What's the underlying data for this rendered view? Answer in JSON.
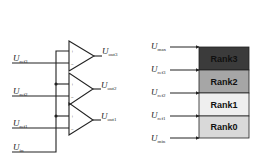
{
  "comparator_circuit": {
    "inputs": [
      {
        "base": "U",
        "sub": "ref3"
      },
      {
        "base": "U",
        "sub": "ref2"
      },
      {
        "base": "U",
        "sub": "ref1"
      },
      {
        "base": "U",
        "sub": "in"
      }
    ],
    "outputs": [
      {
        "base": "U",
        "sub": "out3"
      },
      {
        "base": "U",
        "sub": "out2"
      },
      {
        "base": "U",
        "sub": "out1"
      }
    ],
    "plus_sign": "+",
    "minus_sign": "−"
  },
  "rank_table": {
    "levels": [
      {
        "base": "U",
        "sub": "max"
      },
      {
        "base": "U",
        "sub": "ref3"
      },
      {
        "base": "U",
        "sub": "ref2"
      },
      {
        "base": "U",
        "sub": "ref1"
      },
      {
        "base": "U",
        "sub": "min"
      }
    ],
    "ranks": [
      {
        "label": "Rank3",
        "color": "#3b3b3b",
        "text_color": "#111111"
      },
      {
        "label": "Rank2",
        "color": "#a6a6a6",
        "text_color": "#111111"
      },
      {
        "label": "Rank1",
        "color": "#efefef",
        "text_color": "#111111"
      },
      {
        "label": "Rank0",
        "color": "#d9d9d9",
        "text_color": "#111111"
      }
    ]
  }
}
